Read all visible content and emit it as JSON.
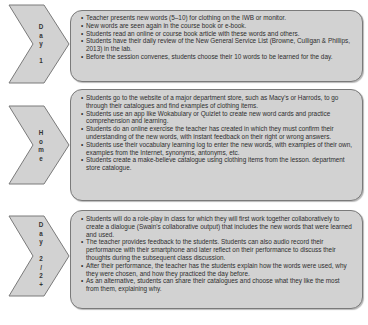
{
  "diagram": {
    "stages": [
      {
        "label_chars": [
          "D",
          "a",
          "y",
          "",
          "1"
        ],
        "label": "Day 1",
        "items": [
          "Teacher presents new words (5–10) for clothing on the IWB or monitor.",
          "New words are seen again in the course book or e-book.",
          "Students read an online or course book article with these words and others.",
          "Students have their daily review of the New General Service List (Browne, Culligan & Phillips, 2013) in the lab.",
          "Before the session convenes, students choose their 10 words to be learned for the day."
        ]
      },
      {
        "label_chars": [
          "H",
          "o",
          "m",
          "e"
        ],
        "label": "Home",
        "items": [
          "Students go to the website of a major department store, such as Macy's or Harrods, to go through their catalogues and find examples of clothing items.",
          "Students use an app like Wokabulary or Quizlet to create new word cards and practice comprehension and learning.",
          "Students do an online exercise the teacher has created in which they must confirm their understanding of the new words, with instant feedback on their right or wrong answers.",
          "Students use their vocabulary learning log to enter the new words, with examples of their own, examples from the Internet, synonyms, antonyms, etc.",
          "Students create a make-believe catalogue using clothing items from the lesson. department store catalogue."
        ]
      },
      {
        "label_chars": [
          "D",
          "a",
          "y",
          "",
          "2",
          "/",
          "2",
          "+"
        ],
        "label": "Day 2/2+",
        "items": [
          "Students will do a role-play in class for which they will first work together collaboratively to create a dialogue (Swain's collaborative output) that includes the new words that were learned and used.",
          "The teacher provides feedback to the students. Students can also audio record their performance with their smartphone and later reflect on their performance to discuss their thoughts during the subsequent class discussion.",
          "After their performance, the teacher has the students explain how the words were used, why they were chosen, and how they practiced the day before.",
          "As an alternative, students can share their catalogues and choose what they like the most from them, explaining why."
        ]
      }
    ],
    "colors": {
      "fill": "#d2d2d2",
      "border": "#7a7a7a"
    }
  }
}
